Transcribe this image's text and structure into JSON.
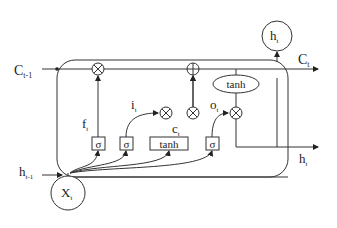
{
  "diagram": {
    "inputs": {
      "cell_state_prev": {
        "main": "C",
        "sub": "t-1"
      },
      "hidden_prev": {
        "main": "h",
        "sub": "t-1"
      },
      "x_input": {
        "main": "X",
        "sub": "t"
      }
    },
    "outputs": {
      "cell_state": {
        "main": "C",
        "sub": "t"
      },
      "hidden_out": {
        "main": "h",
        "sub": "t"
      },
      "hidden_top": {
        "main": "h",
        "sub": "t"
      }
    },
    "gates": {
      "forget": {
        "main": "f",
        "sub": "t",
        "activation": "σ"
      },
      "input": {
        "main": "i",
        "sub": "t",
        "activation": "σ"
      },
      "candidate": {
        "main": "c",
        "sub": "t",
        "activation": "tanh"
      },
      "output": {
        "main": "o",
        "sub": "t",
        "activation": "σ"
      }
    },
    "operators": {
      "multiply": "⊗",
      "add": "⊕"
    },
    "cell_tanh": "tanh",
    "colors": {
      "line": "#333333",
      "background": "#ffffff"
    }
  }
}
